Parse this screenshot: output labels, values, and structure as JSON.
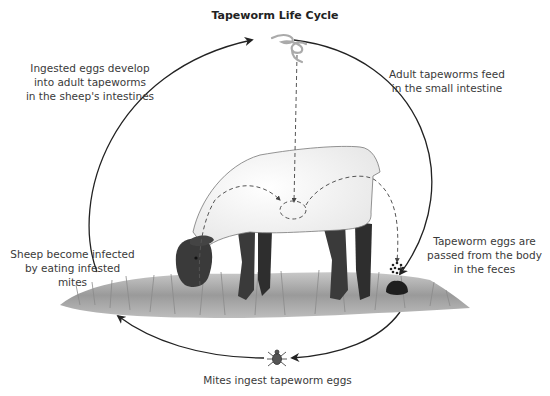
{
  "title": "Tapeworm Life Cycle",
  "stages": [
    {
      "id": "ingest-develop",
      "lines": [
        "Ingested eggs develop",
        "into adult tapeworms",
        "in the sheep's intestines"
      ]
    },
    {
      "id": "adult-feed",
      "lines": [
        "Adult tapeworms feed",
        "in the small intestine"
      ]
    },
    {
      "id": "eggs-passed",
      "lines": [
        "Tapeworm eggs are",
        "passed from the body",
        "in the feces"
      ]
    },
    {
      "id": "mites-ingest",
      "lines": [
        "Mites ingest tapeworm eggs"
      ]
    },
    {
      "id": "sheep-infected",
      "lines": [
        "Sheep become infected",
        "by eating infested mites"
      ]
    }
  ],
  "icons": {
    "tapeworm": "tapeworm-icon",
    "sheep": "sheep-illustration",
    "eggs": "eggs-icon",
    "feces": "feces-icon",
    "mite": "mite-icon",
    "grass": "grass-illustration"
  },
  "colors": {
    "arrow": "#222222",
    "dashed": "#555555",
    "sheep_body": "#f4f4f4",
    "sheep_dark": "#3a3a3a",
    "grass": "#9a9a9a",
    "tapeworm": "#aaaaaa"
  }
}
